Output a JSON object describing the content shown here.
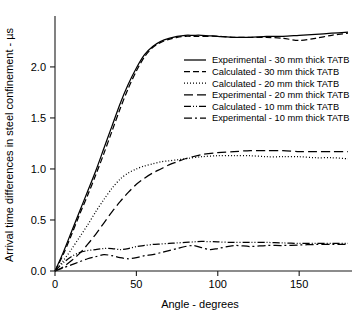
{
  "chart_data": {
    "type": "line",
    "title": "",
    "xlabel": "Angle - degrees",
    "ylabel": "Arrival time differences in steel confinement - µs",
    "xlim": [
      0,
      180
    ],
    "ylim": [
      0,
      2.45
    ],
    "xticks": [
      0,
      50,
      100,
      150
    ],
    "xtick_labels": [
      "0",
      "50",
      "100",
      "150"
    ],
    "yticks": [
      0.0,
      0.5,
      1.0,
      1.5,
      2.0
    ],
    "ytick_labels": [
      "0.0",
      "0.5",
      "1.0",
      "1.5",
      "2.0"
    ],
    "grid": false,
    "legend_position": "center-right",
    "series": [
      {
        "name": "Experimental - 30 mm thick TATB",
        "style": "solid",
        "dash": "none",
        "x": [
          0,
          5,
          10,
          15,
          20,
          25,
          30,
          35,
          40,
          45,
          50,
          55,
          60,
          65,
          70,
          75,
          80,
          85,
          90,
          100,
          110,
          120,
          130,
          140,
          150,
          160,
          170,
          180
        ],
        "y": [
          0.0,
          0.18,
          0.38,
          0.58,
          0.78,
          0.98,
          1.2,
          1.42,
          1.64,
          1.83,
          1.99,
          2.12,
          2.2,
          2.25,
          2.28,
          2.3,
          2.31,
          2.31,
          2.31,
          2.3,
          2.29,
          2.29,
          2.3,
          2.3,
          2.31,
          2.32,
          2.33,
          2.34
        ]
      },
      {
        "name": "Calculated - 30 mm thick TATB",
        "style": "dashed",
        "dash": "6,3",
        "x": [
          0,
          5,
          10,
          15,
          20,
          25,
          30,
          35,
          40,
          45,
          50,
          55,
          60,
          65,
          70,
          75,
          80,
          85,
          90,
          100,
          110,
          120,
          130,
          140,
          150,
          160,
          170,
          180
        ],
        "y": [
          0.0,
          0.16,
          0.35,
          0.55,
          0.74,
          0.94,
          1.15,
          1.37,
          1.59,
          1.79,
          1.96,
          2.1,
          2.19,
          2.24,
          2.27,
          2.29,
          2.3,
          2.3,
          2.3,
          2.3,
          2.29,
          2.29,
          2.29,
          2.28,
          2.26,
          2.28,
          2.31,
          2.33
        ]
      },
      {
        "name": "Calculated - 20 mm thick TATB",
        "style": "dotted",
        "dash": "1,2",
        "x": [
          0,
          5,
          10,
          15,
          20,
          25,
          30,
          35,
          40,
          45,
          50,
          55,
          60,
          65,
          70,
          75,
          80,
          90,
          100,
          110,
          120,
          130,
          140,
          150,
          160,
          170,
          180
        ],
        "y": [
          0.0,
          0.1,
          0.21,
          0.33,
          0.45,
          0.58,
          0.7,
          0.81,
          0.9,
          0.96,
          1.0,
          1.03,
          1.05,
          1.07,
          1.08,
          1.09,
          1.1,
          1.12,
          1.13,
          1.13,
          1.13,
          1.12,
          1.12,
          1.12,
          1.11,
          1.11,
          1.1
        ]
      },
      {
        "name": "Experimental - 20 mm thick TATB",
        "style": "long-dash",
        "dash": "9,4",
        "x": [
          0,
          5,
          10,
          15,
          20,
          25,
          30,
          35,
          40,
          45,
          50,
          55,
          60,
          65,
          70,
          75,
          80,
          90,
          100,
          110,
          120,
          130,
          140,
          150,
          160,
          170,
          180
        ],
        "y": [
          0.0,
          0.04,
          0.1,
          0.17,
          0.26,
          0.36,
          0.47,
          0.58,
          0.68,
          0.77,
          0.85,
          0.91,
          0.96,
          1.0,
          1.04,
          1.07,
          1.1,
          1.14,
          1.16,
          1.17,
          1.18,
          1.18,
          1.18,
          1.17,
          1.17,
          1.17,
          1.17
        ]
      },
      {
        "name": "Calculated - 10 mm thick TATB",
        "style": "dash-dot-dot",
        "dash": "7,2,1,2,1,2",
        "x": [
          0,
          5,
          10,
          15,
          20,
          25,
          30,
          35,
          40,
          45,
          50,
          55,
          60,
          65,
          70,
          75,
          80,
          85,
          90,
          100,
          110,
          120,
          130,
          140,
          150,
          160,
          170,
          180
        ],
        "y": [
          0.0,
          0.08,
          0.14,
          0.18,
          0.2,
          0.21,
          0.22,
          0.22,
          0.21,
          0.22,
          0.24,
          0.25,
          0.26,
          0.265,
          0.27,
          0.275,
          0.28,
          0.285,
          0.29,
          0.285,
          0.28,
          0.28,
          0.28,
          0.275,
          0.27,
          0.27,
          0.27,
          0.27
        ]
      },
      {
        "name": "Experimental - 10 mm thick TATB",
        "style": "dash-dot",
        "dash": "8,3,2,3",
        "x": [
          0,
          5,
          10,
          15,
          20,
          25,
          30,
          35,
          40,
          45,
          50,
          55,
          60,
          65,
          70,
          75,
          80,
          85,
          90,
          95,
          100,
          110,
          120,
          130,
          140,
          150,
          160,
          170,
          180
        ],
        "y": [
          0.0,
          0.03,
          0.06,
          0.09,
          0.12,
          0.14,
          0.16,
          0.15,
          0.13,
          0.12,
          0.13,
          0.15,
          0.16,
          0.18,
          0.2,
          0.22,
          0.24,
          0.25,
          0.23,
          0.21,
          0.22,
          0.25,
          0.24,
          0.25,
          0.25,
          0.255,
          0.26,
          0.26,
          0.26
        ]
      }
    ],
    "legend": [
      "Experimental - 30 mm thick TATB",
      "Calculated - 30 mm thick TATB",
      "Calculated - 20 mm thick TATB",
      "Experimental - 20 mm thick TATB",
      "Calculated - 10 mm thick TATB",
      "Experimental - 10 mm thick TATB"
    ]
  }
}
